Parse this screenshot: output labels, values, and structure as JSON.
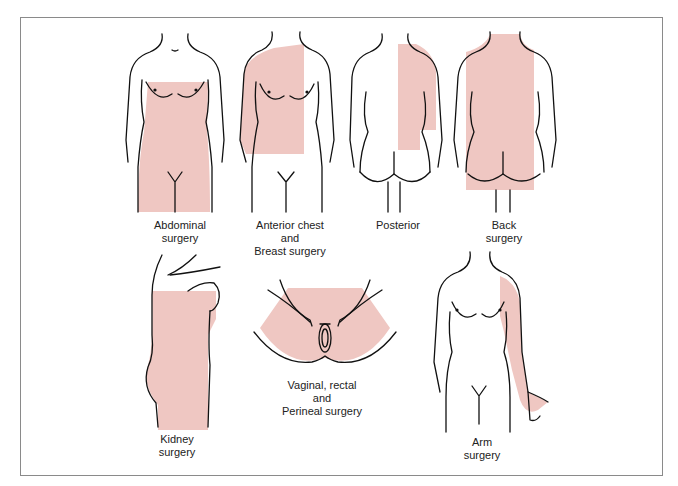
{
  "colors": {
    "highlight": "#efc7c2",
    "outline": "#111111",
    "border": "#8a8a8a",
    "text": "#222222"
  },
  "figures": [
    {
      "id": "abdominal",
      "view": "front",
      "label_lines": [
        "Abdominal",
        "surgery"
      ]
    },
    {
      "id": "anterior-chest-breast",
      "view": "front",
      "label_lines": [
        "Anterior chest",
        "and",
        "Breast surgery"
      ]
    },
    {
      "id": "posterior",
      "view": "back",
      "label_lines": [
        "Posterior"
      ]
    },
    {
      "id": "back",
      "view": "back",
      "label_lines": [
        "Back",
        "surgery"
      ]
    },
    {
      "id": "kidney",
      "view": "side",
      "label_lines": [
        "Kidney",
        "surgery"
      ]
    },
    {
      "id": "vaginal-rectal-perineal",
      "view": "perineum",
      "label_lines": [
        "Vaginal, rectal",
        "and",
        "Perineal surgery"
      ]
    },
    {
      "id": "arm",
      "view": "front",
      "label_lines": [
        "Arm",
        "surgery"
      ]
    }
  ]
}
